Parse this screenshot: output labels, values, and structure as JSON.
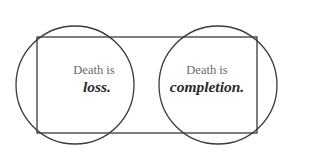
{
  "diagram": {
    "type": "venn-with-frame",
    "stroke_color": "#3a3a3a",
    "background": "#ffffff",
    "left_circle": {
      "cx": 75,
      "cy": 85,
      "r": 59
    },
    "right_circle": {
      "cx": 218,
      "cy": 85,
      "r": 59
    },
    "frame": {
      "x": 37,
      "y": 37,
      "width": 220,
      "height": 96
    },
    "left_label": {
      "line1": "Death is",
      "line2": "loss."
    },
    "right_label": {
      "line1": "Death is",
      "line2": "completion."
    }
  }
}
